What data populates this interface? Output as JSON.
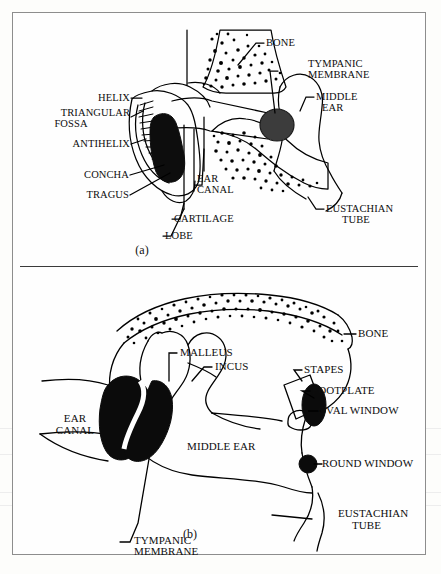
{
  "figure": {
    "panels": [
      {
        "id": "a",
        "caption": "(a)",
        "description": "Outer ear, ear canal, tympanic membrane and middle ear",
        "labels": [
          {
            "key": "helix",
            "text": "HELIX",
            "align": "right"
          },
          {
            "key": "triangular_fossa",
            "text": "TRIANGULAR\nFOSSA",
            "align": "right"
          },
          {
            "key": "antihelix",
            "text": "ANTIHELIX",
            "align": "right"
          },
          {
            "key": "concha",
            "text": "CONCHA",
            "align": "right"
          },
          {
            "key": "tragus",
            "text": "TRAGUS",
            "align": "right"
          },
          {
            "key": "lobe",
            "text": "LOBE",
            "align": "left"
          },
          {
            "key": "cartilage",
            "text": "CARTILAGE",
            "align": "left"
          },
          {
            "key": "ear_canal",
            "text": "EAR\nCANAL",
            "align": "left"
          },
          {
            "key": "bone",
            "text": "BONE",
            "align": "left"
          },
          {
            "key": "tympanic_membrane",
            "text": "TYMPANIC\nMEMBRANE",
            "align": "left"
          },
          {
            "key": "middle_ear",
            "text": "MIDDLE\nEAR",
            "align": "left"
          },
          {
            "key": "eustachian_tube",
            "text": "EUSTACHIAN\nTUBE",
            "align": "left"
          }
        ]
      },
      {
        "id": "b",
        "caption": "(b)",
        "description": "Middle ear detail with ossicles",
        "labels": [
          {
            "key": "bone",
            "text": "BONE",
            "align": "left"
          },
          {
            "key": "malleus",
            "text": "MALLEUS",
            "align": "left"
          },
          {
            "key": "incus",
            "text": "INCUS",
            "align": "left"
          },
          {
            "key": "stapes",
            "text": "STAPES",
            "align": "left"
          },
          {
            "key": "footplate",
            "text": "FOOTPLATE",
            "align": "left"
          },
          {
            "key": "oval_window",
            "text": "OVAL WINDOW",
            "align": "left"
          },
          {
            "key": "round_window",
            "text": "ROUND WINDOW",
            "align": "left"
          },
          {
            "key": "eustachian_tube",
            "text": "EUSTACHIAN\nTUBE",
            "align": "left"
          },
          {
            "key": "ear_canal",
            "text": "EAR\nCANAL",
            "align": "center"
          },
          {
            "key": "middle_ear",
            "text": "MIDDLE EAR",
            "align": "center"
          },
          {
            "key": "tympanic_membrane",
            "text": "TYMPANIC\nMEMBRANE",
            "align": "left"
          }
        ]
      }
    ]
  },
  "colors": {
    "ink": "#000000",
    "paper": "#fdfdfb",
    "frame": "#8d8d8d",
    "fill_solid": "#101010",
    "membrane_a": "#3a3a3a"
  },
  "labels_a": {
    "helix": "HELIX",
    "triangular_fossa_1": "TRIANGULAR",
    "triangular_fossa_2": "FOSSA",
    "antihelix": "ANTIHELIX",
    "concha": "CONCHA",
    "tragus": "TRAGUS",
    "lobe": "LOBE",
    "cartilage": "CARTILAGE",
    "ear_canal_1": "EAR",
    "ear_canal_2": "CANAL",
    "bone": "BONE",
    "tympanic_1": "TYMPANIC",
    "tympanic_2": "MEMBRANE",
    "middle_1": "MIDDLE",
    "middle_2": "EAR",
    "eustachian_1": "EUSTACHIAN",
    "eustachian_2": "TUBE",
    "caption": "(a)"
  },
  "labels_b": {
    "bone": "BONE",
    "malleus": "MALLEUS",
    "incus": "INCUS",
    "stapes": "STAPES",
    "footplate": "FOOTPLATE",
    "oval_window": "OVAL WINDOW",
    "round_window": "ROUND WINDOW",
    "eustachian_1": "EUSTACHIAN",
    "eustachian_2": "TUBE",
    "ear_canal_1": "EAR",
    "ear_canal_2": "CANAL",
    "middle_ear": "MIDDLE EAR",
    "tympanic_1": "TYMPANIC",
    "tympanic_2": "MEMBRANE",
    "caption": "(b)"
  }
}
